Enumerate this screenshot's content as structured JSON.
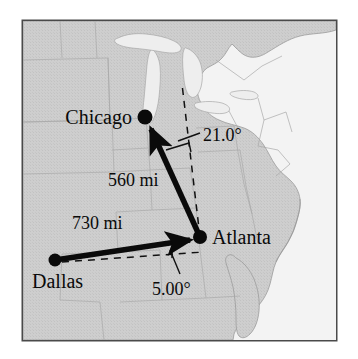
{
  "figure": {
    "type": "vector-diagram-on-map",
    "title": "",
    "frame": {
      "border_color": "#4a4a4a",
      "background_land": "#cfcfcf",
      "background_water": "#f2f2f2",
      "x": 22,
      "y": 20,
      "width": 315,
      "height": 321
    },
    "cities": [
      {
        "name": "Chicago",
        "dot_x": 145,
        "dot_y": 117,
        "label_x": 132,
        "label_y": 124,
        "label_anchor": "end"
      },
      {
        "name": "Atlanta",
        "dot_x": 200,
        "dot_y": 237,
        "label_x": 212,
        "label_y": 244,
        "label_anchor": "start"
      },
      {
        "name": "Dallas",
        "dot_x": 55,
        "dot_y": 260,
        "label_x": 46,
        "label_y": 288,
        "label_anchor": "start"
      }
    ],
    "vectors": [
      {
        "name": "dallas-to-atlanta",
        "from": "Dallas",
        "to": "Atlanta",
        "magnitude": "730 mi",
        "magnitude_x": 108,
        "magnitude_y": 225,
        "angle": "5.00°",
        "angle_reference": "horizontal",
        "x1": 55,
        "y1": 260,
        "x2": 196,
        "y2": 239
      },
      {
        "name": "atlanta-to-chicago",
        "from": "Atlanta",
        "to": "Chicago",
        "magnitude": "560 mi",
        "magnitude_x": 138,
        "magnitude_y": 180,
        "angle": "21.0°",
        "angle_reference": "vertical",
        "x1": 200,
        "y1": 237,
        "x2": 148,
        "y2": 123
      }
    ],
    "annotations": [
      {
        "name": "angle-21",
        "text": "21.0°",
        "x": 206,
        "y": 136
      },
      {
        "name": "angle-5",
        "text": "5.00°",
        "x": 164,
        "y": 288
      }
    ],
    "reference_lines": [
      {
        "name": "vertical-dashed-from-atlanta",
        "x1": 200,
        "y1": 237,
        "x2": 182,
        "y2": 84,
        "style": "dashed"
      },
      {
        "name": "horizontal-dashed-from-dallas",
        "x1": 62,
        "y1": 262,
        "x2": 204,
        "y2": 252,
        "style": "dashed"
      }
    ],
    "map_region": "Eastern United States"
  }
}
